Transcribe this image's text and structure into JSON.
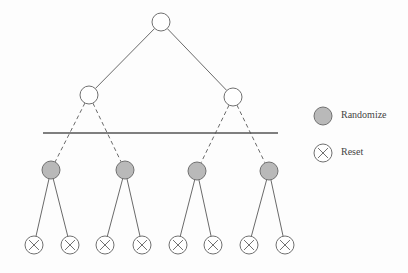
{
  "colors": {
    "edge": "#6a6a6a",
    "node_stroke": "#707070",
    "node_fill_plain": "#ffffff",
    "node_fill_randomize": "#b9b9b9",
    "divider": "#555555"
  },
  "tree": {
    "root": {
      "x": 161,
      "y": 22
    },
    "level1": [
      {
        "x": 89,
        "y": 95
      },
      {
        "x": 233,
        "y": 97
      }
    ],
    "divider": {
      "x1": 43,
      "y1": 133,
      "x2": 278,
      "y2": 133
    },
    "level2_randomize": [
      {
        "x": 51,
        "y": 170
      },
      {
        "x": 125,
        "y": 170
      },
      {
        "x": 197,
        "y": 171
      },
      {
        "x": 269,
        "y": 171
      }
    ],
    "leaves_reset": [
      {
        "x": 34,
        "y": 245
      },
      {
        "x": 70,
        "y": 245
      },
      {
        "x": 105,
        "y": 245
      },
      {
        "x": 142,
        "y": 245
      },
      {
        "x": 178,
        "y": 245
      },
      {
        "x": 213,
        "y": 245
      },
      {
        "x": 249,
        "y": 245
      },
      {
        "x": 285,
        "y": 245
      }
    ],
    "node_radius": 9
  },
  "legend": {
    "items": [
      {
        "label": "Randomize",
        "symbol": "gray-filled-circle",
        "x": 323,
        "y": 116
      },
      {
        "label": "Reset",
        "symbol": "circle-with-x",
        "x": 323,
        "y": 153
      }
    ]
  }
}
